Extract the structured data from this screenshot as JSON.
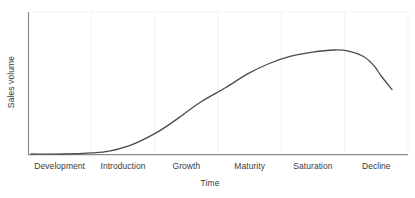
{
  "chart_data": {
    "type": "line",
    "title": "",
    "xlabel": "Time",
    "ylabel": "Sales volume",
    "categories": [
      "Development",
      "Introduction",
      "Growth",
      "Maturity",
      "Saturation",
      "Decline"
    ],
    "series": [
      {
        "name": "Sales volume",
        "points": [
          {
            "x": 0.0,
            "y": 0.0
          },
          {
            "x": 0.09,
            "y": 0.0
          },
          {
            "x": 0.17,
            "y": 0.01
          },
          {
            "x": 0.22,
            "y": 0.03
          },
          {
            "x": 0.28,
            "y": 0.09
          },
          {
            "x": 0.35,
            "y": 0.21
          },
          {
            "x": 0.41,
            "y": 0.35
          },
          {
            "x": 0.47,
            "y": 0.5
          },
          {
            "x": 0.54,
            "y": 0.64
          },
          {
            "x": 0.6,
            "y": 0.77
          },
          {
            "x": 0.66,
            "y": 0.87
          },
          {
            "x": 0.72,
            "y": 0.94
          },
          {
            "x": 0.78,
            "y": 0.98
          },
          {
            "x": 0.84,
            "y": 1.0
          },
          {
            "x": 0.88,
            "y": 0.99
          },
          {
            "x": 0.92,
            "y": 0.94
          },
          {
            "x": 0.95,
            "y": 0.85
          },
          {
            "x": 0.97,
            "y": 0.75
          },
          {
            "x": 1.0,
            "y": 0.62
          }
        ]
      }
    ],
    "xlim": [
      0,
      1
    ],
    "ylim": [
      0,
      1
    ],
    "grid": "vertical",
    "gridline_positions": [
      0.1667,
      0.3333,
      0.5,
      0.6667,
      0.8333
    ],
    "legend": "none",
    "axis_ticks_shown": false,
    "colors": {
      "curve": "#4a4a52",
      "axis": "#8a8a8a",
      "gridline": "#f0f0f0",
      "text": "#3a3a3a",
      "background": "#ffffff",
      "plot_border": "#f4f4f4"
    }
  }
}
